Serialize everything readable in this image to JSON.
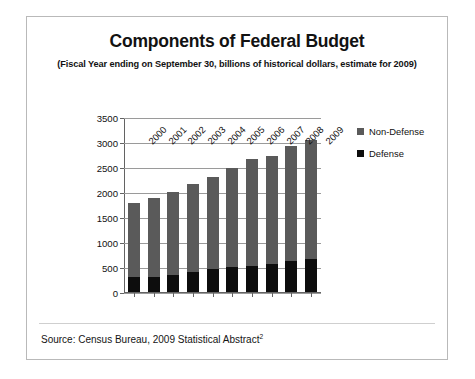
{
  "chart_data": {
    "type": "bar",
    "stacked": true,
    "title": "Components of Federal Budget",
    "subtitle": "(Fiscal Year ending on September 30, billions of historical dollars, estimate for 2009)",
    "xlabel": "",
    "ylabel": "",
    "categories": [
      "2000",
      "2001",
      "2002",
      "2003",
      "2004",
      "2005",
      "2006",
      "2007",
      "2008",
      "2009"
    ],
    "series": [
      {
        "name": "Defense",
        "color": "#0d0d0d",
        "values": [
          300,
          310,
          350,
          405,
          455,
          495,
          522,
          552,
          616,
          651
        ]
      },
      {
        "name": "Non-Defense",
        "color": "#5a5a5a",
        "values": [
          1490,
          1580,
          1660,
          1755,
          1837,
          1977,
          2133,
          2178,
          2314,
          2389
        ]
      }
    ],
    "totals": [
      1790,
      1890,
      2010,
      2160,
      2292,
      2472,
      2655,
      2730,
      2930,
      3040
    ],
    "ylim": [
      0,
      3500
    ],
    "yticks": [
      0,
      500,
      1000,
      1500,
      2000,
      2500,
      3000,
      3500
    ],
    "ytick_labels": [
      "0",
      "500",
      "1000",
      "1500",
      "2000",
      "2500",
      "3000",
      "3500"
    ],
    "grid": true,
    "grid_axis": "y",
    "legend_position": "right",
    "legend_entries": [
      "Non-Defense",
      "Defense"
    ]
  },
  "source": {
    "text": "Source: Census Bureau, 2009 Statistical Abstract",
    "footnote_marker": "2"
  }
}
